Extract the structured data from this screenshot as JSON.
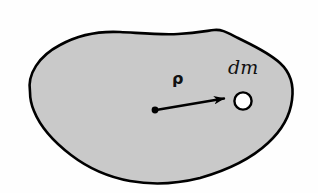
{
  "figure": {
    "name": "rigid-body-mass-element-diagram",
    "background_color": "#fefefe"
  },
  "body": {
    "name": "rigid-body-blob",
    "fill_color": "#c9c9c9",
    "outline_color": "#000000",
    "outline_width": 2.6
  },
  "vector": {
    "label": "ρ",
    "name": "position-vector-rho",
    "color": "#000000",
    "tail": {
      "x": 155,
      "y": 110
    },
    "tip": {
      "x": 233,
      "y": 97
    }
  },
  "mass_element": {
    "label": "dm",
    "name": "mass-element-dm",
    "marker_fill": "#ffffff",
    "marker_outline": "#000000",
    "center": {
      "x": 243,
      "y": 101
    },
    "radius": 9
  },
  "origin_point": {
    "name": "vector-origin-dot",
    "color": "#000000",
    "radius": 3.4
  }
}
